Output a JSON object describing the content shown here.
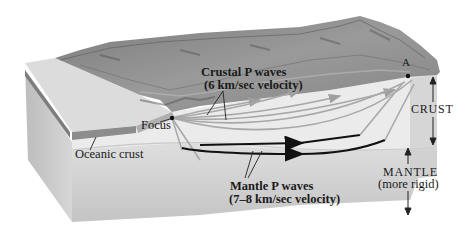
{
  "figure": {
    "type": "block-diagram"
  },
  "labels": {
    "crustal_waves_line1": "Crustal P waves",
    "crustal_waves_line2": "(6 km/sec velocity)",
    "mantle_waves_line1": "Mantle P waves",
    "mantle_waves_line2": "(7–8 km/sec velocity)",
    "focus": "Focus",
    "oceanic_crust": "Oceanic crust",
    "station": "A",
    "crust": "CRUST",
    "mantle": "MANTLE",
    "mantle_note": "(more rigid)"
  },
  "colors": {
    "crust_face": "#e4e4e4",
    "mantle_face": "#cfcfcf",
    "terrain": "#8a8a8a",
    "oceanic_band": "#8c8c8c",
    "crustal_wave": "#a8a8a8",
    "mantle_wave": "#111111",
    "text": "#1a1a1a"
  }
}
